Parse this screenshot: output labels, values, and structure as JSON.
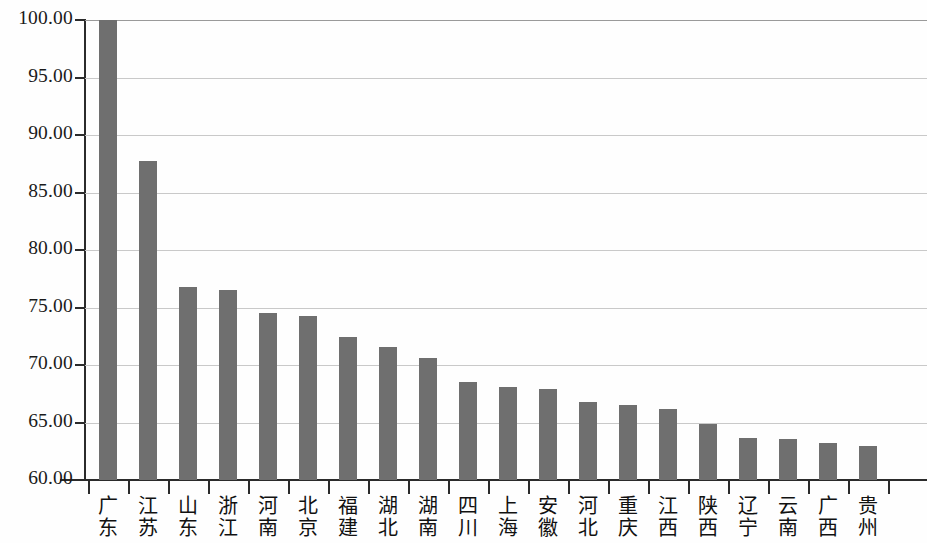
{
  "chart_data": {
    "type": "bar",
    "title": "",
    "subtitle": "",
    "xlabel": "",
    "ylabel": "",
    "ylim": [
      60.0,
      100.0
    ],
    "ytick_labels": [
      "100.00",
      "95.00",
      "90.00",
      "85.00",
      "80.00",
      "75.00",
      "70.00",
      "65.00",
      "60.00"
    ],
    "ytick_values": [
      100.0,
      95.0,
      90.0,
      85.0,
      80.0,
      75.0,
      70.0,
      65.0,
      60.0
    ],
    "grid": true,
    "legend": "none",
    "categories": [
      "广东",
      "江苏",
      "山东",
      "浙江",
      "河南",
      "北京",
      "福建",
      "湖北",
      "湖南",
      "四川",
      "上海",
      "安徽",
      "河北",
      "重庆",
      "江西",
      "陕西",
      "辽宁",
      "云南",
      "广西",
      "贵州"
    ],
    "values": [
      100.0,
      87.7,
      76.8,
      76.55,
      74.55,
      74.3,
      72.45,
      71.55,
      70.6,
      68.5,
      68.05,
      67.95,
      66.75,
      66.5,
      66.15,
      64.9,
      63.65,
      63.55,
      63.25,
      62.95
    ],
    "bar_color": "#6f6f6f",
    "grid_color": "#c9c9c9",
    "axis_color": "#2b2b2b"
  }
}
